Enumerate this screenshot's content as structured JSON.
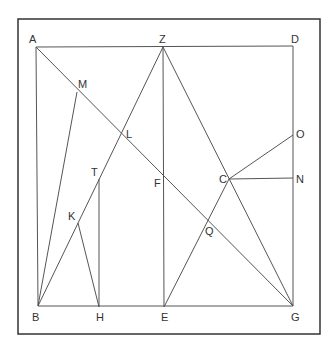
{
  "frame": {
    "x": 18,
    "y": 19,
    "w": 302,
    "h": 315,
    "stroke": "#333333"
  },
  "points": {
    "A": {
      "x": 36,
      "y": 47,
      "lx": 29,
      "ly": 43
    },
    "Z": {
      "x": 163,
      "y": 47,
      "lx": 159,
      "ly": 43
    },
    "D": {
      "x": 293,
      "y": 46,
      "lx": 291,
      "ly": 43
    },
    "B": {
      "x": 38,
      "y": 306,
      "lx": 32,
      "ly": 321
    },
    "H": {
      "x": 99,
      "y": 307,
      "lx": 96,
      "ly": 321
    },
    "E": {
      "x": 164,
      "y": 307,
      "lx": 161,
      "ly": 321
    },
    "G": {
      "x": 293,
      "y": 306,
      "lx": 291,
      "ly": 321
    },
    "M": {
      "x": 77,
      "y": 92,
      "lx": 78,
      "ly": 88
    },
    "L": {
      "x": 121,
      "y": 134,
      "lx": 126,
      "ly": 138
    },
    "T": {
      "x": 99,
      "y": 179,
      "lx": 91,
      "ly": 176
    },
    "K": {
      "x": 78,
      "y": 223,
      "lx": 68,
      "ly": 220
    },
    "F": {
      "x": 163,
      "y": 177,
      "lx": 154,
      "ly": 187
    },
    "C": {
      "x": 229,
      "y": 179,
      "lx": 219,
      "ly": 183
    },
    "O": {
      "x": 293,
      "y": 135,
      "lx": 296,
      "ly": 138
    },
    "N": {
      "x": 293,
      "y": 178,
      "lx": 296,
      "ly": 183
    },
    "Q": {
      "x": 208,
      "y": 221,
      "lx": 205,
      "ly": 235
    }
  },
  "segments": [
    [
      "A",
      "D"
    ],
    [
      "A",
      "B"
    ],
    [
      "D",
      "G"
    ],
    [
      "B",
      "G"
    ],
    [
      "A",
      "G"
    ],
    [
      "Z",
      "B"
    ],
    [
      "Z",
      "G"
    ],
    [
      "Z",
      "E"
    ],
    [
      "M",
      "B"
    ],
    [
      "K",
      "H"
    ],
    [
      "T",
      "H"
    ],
    [
      "E",
      "C"
    ],
    [
      "C",
      "O"
    ],
    [
      "C",
      "N"
    ]
  ],
  "labels": {
    "A": "A",
    "Z": "Z",
    "D": "D",
    "B": "B",
    "H": "H",
    "E": "E",
    "G": "G",
    "M": "M",
    "L": "L",
    "T": "T",
    "K": "K",
    "F": "F",
    "C": "C",
    "O": "O",
    "N": "N",
    "Q": "Q"
  },
  "colors": {
    "line": "#555555",
    "frame": "#333333",
    "text": "#333333"
  }
}
